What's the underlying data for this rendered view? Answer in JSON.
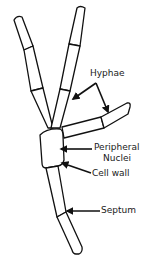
{
  "diagram": {
    "labels": {
      "hyphae": "Hyphae",
      "peripheral_nuclei_line1": "Peripheral",
      "peripheral_nuclei_line2": "Nuclei",
      "cell_wall": "Cell wall",
      "septum": "Septum"
    },
    "colors": {
      "line": "#111111",
      "fill": "#ffffff",
      "text": "#1a1a1a"
    }
  }
}
